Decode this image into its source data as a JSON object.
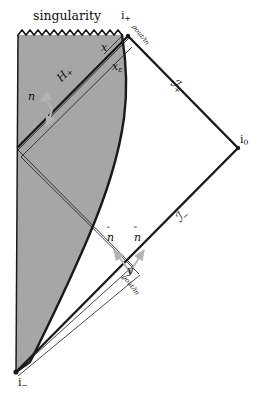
{
  "figure": {
    "type": "penrose-conformal-diagram",
    "background_color": "#ffffff",
    "shaded_region_color": "#a6a6a6",
    "line_color": "#1a1a1a",
    "arrow_color": "#b3b3b3"
  },
  "labels": {
    "singularity": "singularity",
    "i_plus": "i",
    "i_plus_sub": "+",
    "i_zero": "i",
    "i_zero_sub": "0",
    "i_minus": "i",
    "i_minus_sub": "−",
    "horizon": "H",
    "horizon_sub": "+",
    "x": "x",
    "x_epsilon": "x",
    "x_epsilon_sub": "ε",
    "y": "y",
    "scri_plus": "ℐ",
    "scri_plus_sub": "+",
    "scri_minus": "ℐ",
    "scri_minus_sub": "−",
    "n": "n",
    "n_hat": "n",
    "n_tilde": "n",
    "rho_out_in": "ρout/in",
    "varrho_out_in": "ϱout/in"
  },
  "annotations": {
    "normal_vector_label": "n",
    "hat_normal_label": "n-hat",
    "tilde_normal_label": "n-tilde",
    "top_density_label": "rho_out/in",
    "bottom_density_label": "varrho_out/in"
  },
  "geometry": {
    "i_plus_point": [
      128,
      35
    ],
    "i_zero_point": [
      238,
      148
    ],
    "i_minus_point": [
      16,
      372
    ],
    "singularity_left": [
      18,
      33
    ],
    "singularity_right": [
      122,
      33
    ],
    "left_edge_top": [
      18,
      33
    ],
    "left_edge_bottom": [
      16,
      372
    ],
    "reflection_point": [
      18,
      152
    ]
  }
}
